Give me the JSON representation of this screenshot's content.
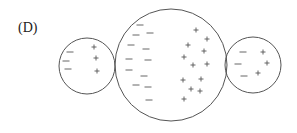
{
  "label": "(D)",
  "colors": {
    "stroke": "#555555",
    "text": "#222222"
  },
  "circles": [
    {
      "name": "left-sphere",
      "cx": 87,
      "cy": 66,
      "r": 28,
      "minus": [
        [
          70,
          52
        ],
        [
          66,
          61
        ],
        [
          68,
          69
        ]
      ],
      "plus": [
        [
          94,
          47
        ],
        [
          96,
          58
        ],
        [
          97,
          71
        ]
      ]
    },
    {
      "name": "center-sphere",
      "cx": 171,
      "cy": 65,
      "r": 56,
      "minus": [
        [
          140,
          25
        ],
        [
          136,
          35
        ],
        [
          150,
          33
        ],
        [
          131,
          45
        ],
        [
          146,
          49
        ],
        [
          129,
          59
        ],
        [
          148,
          60
        ],
        [
          129,
          70
        ],
        [
          144,
          76
        ],
        [
          136,
          85
        ],
        [
          148,
          87
        ],
        [
          149,
          100
        ]
      ],
      "plus": [
        [
          196,
          30
        ],
        [
          207,
          39
        ],
        [
          188,
          45
        ],
        [
          204,
          51
        ],
        [
          184,
          57
        ],
        [
          193,
          65
        ],
        [
          207,
          64
        ],
        [
          183,
          80
        ],
        [
          201,
          79
        ],
        [
          191,
          89
        ],
        [
          200,
          91
        ],
        [
          184,
          99
        ]
      ]
    },
    {
      "name": "right-sphere",
      "cx": 253,
      "cy": 65,
      "r": 28,
      "minus": [
        [
          243,
          52
        ],
        [
          238,
          64
        ],
        [
          244,
          76
        ]
      ],
      "plus": [
        [
          263,
          52
        ],
        [
          267,
          63
        ],
        [
          258,
          73
        ]
      ]
    }
  ]
}
